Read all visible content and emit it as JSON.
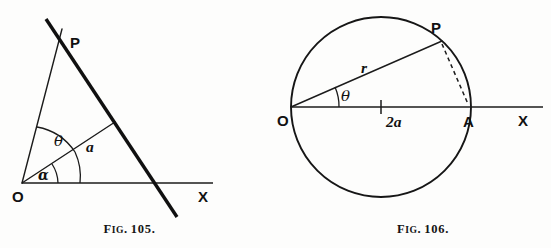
{
  "page": {
    "background_color": "#fdfdfc",
    "ink_color": "#141414",
    "width": 551,
    "height": 248
  },
  "figures": [
    {
      "id": "fig-105",
      "caption_prefix": "F",
      "caption_smallcaps": "IG",
      "caption_number": "105.",
      "caption_full": "FIG. 105.",
      "type": "line-and-angle diagram",
      "labels": {
        "origin": "O",
        "point_p": "P",
        "axis_x": "X",
        "angle_theta": "θ",
        "angle_alpha": "α",
        "length_a": "a"
      },
      "geometry": {
        "origin": [
          22,
          183
        ],
        "point_p": [
          60,
          36
        ],
        "x_axis_end": [
          213,
          183
        ],
        "foot_of_a": [
          112,
          124
        ],
        "thick_line_start": [
          47,
          20
        ],
        "thick_line_end": [
          176,
          216
        ],
        "theta_arc_radius": 58,
        "alpha_arc_radius": 36
      }
    },
    {
      "id": "fig-106",
      "caption_prefix": "F",
      "caption_smallcaps": "IG",
      "caption_number": "106.",
      "caption_full": "FIG. 106.",
      "type": "circle diagram",
      "labels": {
        "origin": "O",
        "point_p": "P",
        "point_a": "A",
        "axis_x": "X",
        "angle_theta": "θ",
        "radius_vector": "r",
        "diameter": "2a"
      },
      "geometry": {
        "circle_center": [
          106,
          107
        ],
        "circle_radius": 90,
        "origin": [
          16,
          107
        ],
        "point_a": [
          196,
          107
        ],
        "point_p": [
          166,
          42
        ],
        "x_axis_end": [
          268,
          107
        ],
        "tick_x": 106,
        "theta_arc_radius": 48
      }
    }
  ]
}
